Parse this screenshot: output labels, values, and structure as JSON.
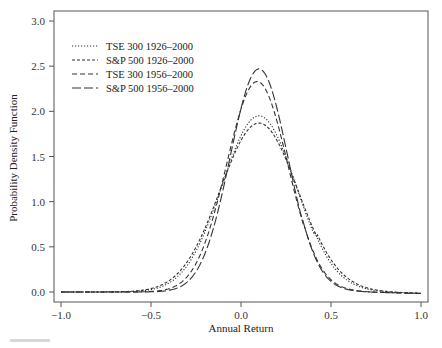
{
  "chart_data": {
    "type": "line",
    "title": "",
    "xlabel": "Annual Return",
    "ylabel": "Probability Density Function",
    "xlim": [
      -1.0,
      1.0
    ],
    "ylim": [
      0.0,
      3.0
    ],
    "xticks": [
      "-1.0",
      "-0.5",
      "0.0",
      "0.5",
      "1.0"
    ],
    "yticks": [
      "0.0",
      "0.5",
      "1.0",
      "1.5",
      "2.0",
      "2.5",
      "3.0"
    ],
    "grid": false,
    "legend_position": "upper-left",
    "series": [
      {
        "name": "TSE 300 1926–2000",
        "style": "dotted",
        "mean": 0.1,
        "sd": 0.205,
        "peak": 1.95,
        "x": [
          -1.0,
          -0.5,
          -0.3,
          -0.2,
          -0.1,
          0.0,
          0.1,
          0.2,
          0.3,
          0.4,
          0.5,
          0.6,
          0.7,
          0.8,
          1.0
        ],
        "y": [
          0.0,
          0.01,
          0.13,
          0.48,
          1.11,
          1.72,
          1.95,
          1.72,
          1.11,
          0.54,
          0.2,
          0.08,
          0.03,
          0.02,
          0.0
        ]
      },
      {
        "name": "S&P 500 1926–2000",
        "style": "short-dash",
        "mean": 0.1,
        "sd": 0.215,
        "peak": 1.87,
        "x": [
          -1.0,
          -0.5,
          -0.3,
          -0.2,
          -0.1,
          0.0,
          0.1,
          0.2,
          0.3,
          0.4,
          0.5,
          0.6,
          0.7,
          0.8,
          1.0
        ],
        "y": [
          0.0,
          0.02,
          0.17,
          0.53,
          1.11,
          1.67,
          1.87,
          1.67,
          1.11,
          0.57,
          0.22,
          0.09,
          0.04,
          0.02,
          0.0
        ]
      },
      {
        "name": "TSE 300 1956–2000",
        "style": "medium-dash",
        "mean": 0.09,
        "sd": 0.17,
        "peak": 2.33,
        "x": [
          -1.0,
          -0.5,
          -0.3,
          -0.2,
          -0.1,
          0.0,
          0.1,
          0.2,
          0.3,
          0.4,
          0.5,
          0.6,
          0.7,
          0.8,
          1.0
        ],
        "y": [
          0.0,
          0.0,
          0.05,
          0.31,
          0.99,
          1.89,
          2.33,
          1.89,
          1.01,
          0.43,
          0.12,
          0.03,
          0.01,
          0.0,
          0.0
        ]
      },
      {
        "name": "S&P 500 1956–2000",
        "style": "long-dash",
        "mean": 0.1,
        "sd": 0.16,
        "peak": 2.47,
        "x": [
          -1.0,
          -0.5,
          -0.3,
          -0.2,
          -0.1,
          0.0,
          0.1,
          0.2,
          0.3,
          0.4,
          0.5,
          0.6,
          0.7,
          0.8,
          1.0
        ],
        "y": [
          0.0,
          0.0,
          0.02,
          0.17,
          0.67,
          1.61,
          2.47,
          2.05,
          1.13,
          0.42,
          0.1,
          0.02,
          0.0,
          0.0,
          0.0
        ]
      }
    ]
  },
  "axes": {
    "x_title": "Annual Return",
    "y_title": "Probability Density Function",
    "x_ticks": [
      "−1.0",
      "−0.5",
      "0.0",
      "0.5",
      "1.0"
    ],
    "y_ticks": [
      "0.0",
      "0.5",
      "1.0",
      "1.5",
      "2.0",
      "2.5",
      "3.0"
    ]
  },
  "legend": {
    "items": [
      {
        "label": "TSE 300 1926–2000",
        "dash": "1.2,1.8"
      },
      {
        "label": "S&P 500 1926–2000",
        "dash": "3,2"
      },
      {
        "label": "TSE 300 1956–2000",
        "dash": "5,3"
      },
      {
        "label": "S&P 500 1956–2000",
        "dash": "9,3"
      }
    ]
  },
  "colors": {
    "line": "#333333",
    "frame": "#555555",
    "background": "#ffffff"
  }
}
